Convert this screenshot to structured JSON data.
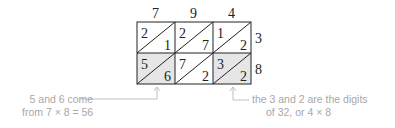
{
  "diagram": {
    "top_digits": [
      "7",
      "9",
      "4"
    ],
    "side_digits": [
      "3",
      "8"
    ],
    "cells": [
      [
        {
          "upper": "2",
          "lower": "1",
          "shaded": false
        },
        {
          "upper": "2",
          "lower": "7",
          "shaded": false
        },
        {
          "upper": "1",
          "lower": "2",
          "shaded": false
        }
      ],
      [
        {
          "upper": "5",
          "lower": "6",
          "shaded": true
        },
        {
          "upper": "7",
          "lower": "2",
          "shaded": false
        },
        {
          "upper": "3",
          "lower": "2",
          "shaded": true
        }
      ]
    ],
    "colors": {
      "grid": "#222222",
      "shade": "#e6e6e6",
      "annotation": "#a8a8a8"
    }
  },
  "annotations": {
    "left_line1": "5 and 6 come",
    "left_line2": "from 7 × 8 = 56",
    "right_line1": "the 3 and 2 are the digits",
    "right_line2": "of 32, or 4 × 8"
  }
}
